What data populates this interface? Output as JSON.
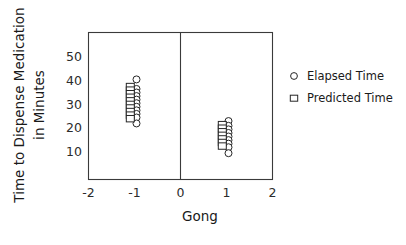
{
  "chart_data": {
    "type": "scatter",
    "title": "",
    "xlabel": "Gong",
    "ylabel": "Time to Dispense Medication in Minutes",
    "ylabel_line1": "Time to Dispense Medication",
    "ylabel_line2": "in Minutes",
    "xlim": [
      -2,
      2
    ],
    "ylim": [
      5,
      57
    ],
    "xticks": [
      -2,
      -1,
      0,
      1,
      2
    ],
    "xticklabels": [
      "-2",
      "-1",
      "0",
      "1",
      "2"
    ],
    "yticks": [
      10,
      20,
      30,
      40,
      50
    ],
    "yticklabels": [
      "10",
      "20",
      "30",
      "40",
      "50"
    ],
    "grid": false,
    "legend_position": "right",
    "reference_line_x": 0,
    "series": [
      {
        "name": "Elapsed Time",
        "marker": "circle",
        "color": "#262626",
        "points": [
          {
            "x": -1,
            "y": 40.5
          },
          {
            "x": -1,
            "y": 36.5
          },
          {
            "x": -1,
            "y": 35.0
          },
          {
            "x": -1,
            "y": 33.5
          },
          {
            "x": -1,
            "y": 32.0
          },
          {
            "x": -1,
            "y": 30.5
          },
          {
            "x": -1,
            "y": 29.0
          },
          {
            "x": -1,
            "y": 27.5
          },
          {
            "x": -1,
            "y": 26.0
          },
          {
            "x": -1,
            "y": 24.5
          },
          {
            "x": -1,
            "y": 22.0
          },
          {
            "x": 1,
            "y": 23.0
          },
          {
            "x": 1,
            "y": 21.0
          },
          {
            "x": 1,
            "y": 19.5
          },
          {
            "x": 1,
            "y": 18.0
          },
          {
            "x": 1,
            "y": 16.5
          },
          {
            "x": 1,
            "y": 15.0
          },
          {
            "x": 1,
            "y": 13.5
          },
          {
            "x": 1,
            "y": 12.0
          },
          {
            "x": 1,
            "y": 9.5
          }
        ]
      },
      {
        "name": "Predicted Time",
        "marker": "square",
        "color": "#262626",
        "points": [
          {
            "x": -1,
            "y": 37.5
          },
          {
            "x": -1,
            "y": 36.0
          },
          {
            "x": -1,
            "y": 34.5
          },
          {
            "x": -1,
            "y": 33.0
          },
          {
            "x": -1,
            "y": 31.5
          },
          {
            "x": -1,
            "y": 30.0
          },
          {
            "x": -1,
            "y": 28.5
          },
          {
            "x": -1,
            "y": 27.0
          },
          {
            "x": -1,
            "y": 25.5
          },
          {
            "x": -1,
            "y": 24.0
          },
          {
            "x": 1,
            "y": 21.5
          },
          {
            "x": 1,
            "y": 20.0
          },
          {
            "x": 1,
            "y": 18.5
          },
          {
            "x": 1,
            "y": 17.0
          },
          {
            "x": 1,
            "y": 15.5
          },
          {
            "x": 1,
            "y": 14.0
          },
          {
            "x": 1,
            "y": 12.5
          }
        ]
      }
    ],
    "legend": [
      {
        "label": "Elapsed Time",
        "marker": "circle"
      },
      {
        "label": "Predicted Time",
        "marker": "square"
      }
    ]
  }
}
